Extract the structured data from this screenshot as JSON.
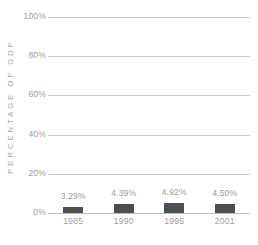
{
  "chart_data": {
    "type": "bar",
    "title": "",
    "subtitle": "",
    "xlabel": "",
    "ylabel": "PERCENTAGE OF GDP",
    "categories": [
      "1985",
      "1990",
      "1995",
      "2001"
    ],
    "values": [
      3.29,
      4.39,
      4.92,
      4.5
    ],
    "value_labels": [
      "3.29%",
      "4.39%",
      "4.92%",
      "4.50%"
    ],
    "ylim": [
      0,
      100
    ],
    "y_ticks": [
      100,
      80,
      60,
      40,
      20,
      0
    ],
    "y_tick_labels": [
      "100%",
      "80%",
      "60%",
      "40%",
      "20%",
      "0%"
    ],
    "grid": true,
    "legend": false,
    "legend_position": "none",
    "colors": {
      "bar": "#4f4f4f",
      "gridline": "#c9c9c9",
      "baseline": "#bdbdbd",
      "tick_text": "#9d9d9d",
      "value_text": "#9b9b9b",
      "axis_title": "#a9a9a9",
      "background": "#ffffff"
    }
  }
}
